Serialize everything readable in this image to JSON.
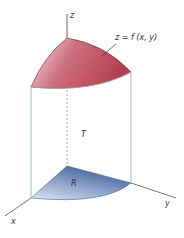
{
  "diagram": {
    "labels": {
      "z_axis": "z",
      "x_axis": "x",
      "y_axis": "y",
      "surface": "z = f (x, y)",
      "solid": "T",
      "region": "R"
    },
    "colors": {
      "surface_dark": "#b2404f",
      "surface_light": "#f2dde0",
      "region_dark": "#3f5f9a",
      "region_light": "#d8e1f0",
      "edge_lines": "#8fb0cc",
      "axis": "#555555"
    }
  }
}
